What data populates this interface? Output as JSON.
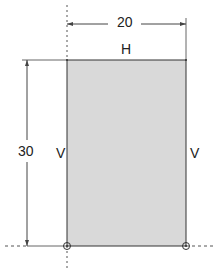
{
  "diagram": {
    "dimensions": {
      "width_label": "20",
      "height_label": "30"
    },
    "constraints": {
      "top_edge": "H",
      "left_edge": "V",
      "right_edge": "V"
    },
    "colors": {
      "fill": "#d9d9d9",
      "stroke": "#333333"
    }
  }
}
